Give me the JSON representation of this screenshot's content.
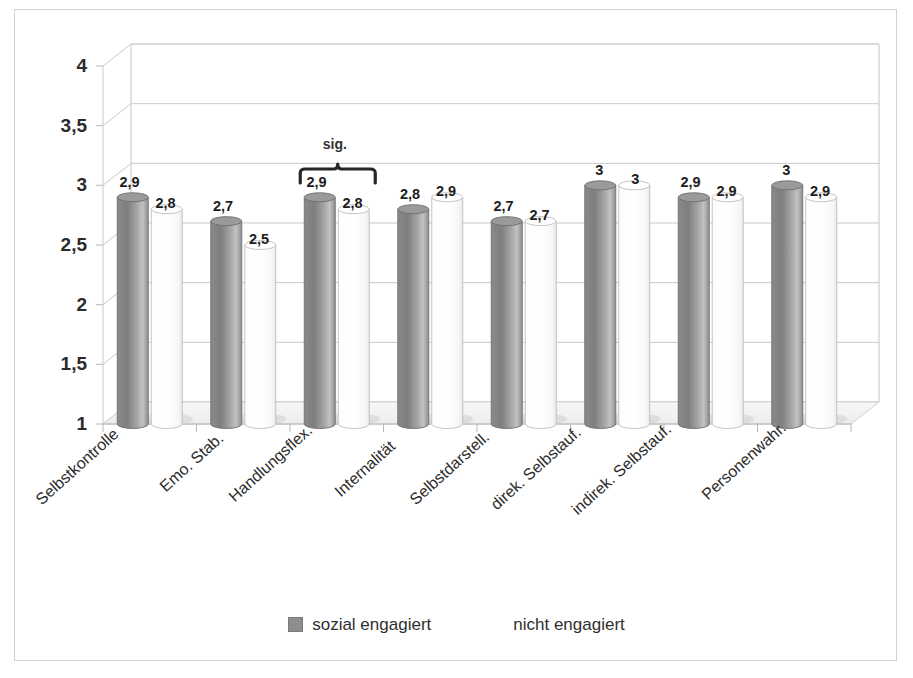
{
  "chart_data": {
    "type": "bar",
    "title": "",
    "subtitle": "",
    "xlabel": "",
    "ylabel": "",
    "ylim": [
      1,
      4
    ],
    "yticks": [
      "1",
      "1,5",
      "2",
      "2,5",
      "3",
      "3,5",
      "4"
    ],
    "ytick_values": [
      1,
      1.5,
      2,
      2.5,
      3,
      3.5,
      4
    ],
    "grid": true,
    "legend_position": "bottom",
    "style": "3d-cylinder",
    "categories": [
      "Selbstkontrolle",
      "Emo. Stab.",
      "Handlungsflex.",
      "Internalität",
      "Selbstdarstell.",
      "direk. Selbstauf.",
      "indirek. Selbstauf.",
      "Personenwahr."
    ],
    "series": [
      {
        "name": "sozial engagiert",
        "color": "#8d8d8d",
        "values": [
          2.9,
          2.7,
          2.9,
          2.8,
          2.7,
          3.0,
          2.9,
          3.0
        ],
        "labels": [
          "2,9",
          "2,7",
          "2,9",
          "2,8",
          "2,7",
          "3",
          "2,9",
          "3"
        ]
      },
      {
        "name": "nicht engagiert",
        "color": "#ffffff",
        "values": [
          2.8,
          2.5,
          2.8,
          2.9,
          2.7,
          3.0,
          2.9,
          2.9
        ],
        "labels": [
          "2,8",
          "2,5",
          "2,8",
          "2,9",
          "2,7",
          "3",
          "2,9",
          "2,9"
        ]
      }
    ],
    "annotations": [
      {
        "text": "sig.",
        "type": "bracket",
        "category": "Handlungsflex.",
        "category_index": 2
      }
    ]
  },
  "legend": {
    "items": [
      {
        "label": "sozial engagiert",
        "swatch": "gray"
      },
      {
        "label": "nicht engagiert",
        "swatch": "white"
      }
    ]
  },
  "colors": {
    "series_gray": "#8d8d8d",
    "series_white": "#ffffff",
    "grid": "#c9c9c9",
    "border": "#d2d2d2",
    "text": "#2b2b2b"
  }
}
